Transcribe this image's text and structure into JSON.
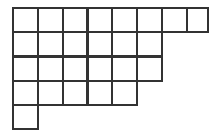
{
  "figure": {
    "name": "staircase-grid-figure",
    "background_color": "#ffffff",
    "line_color": "#333333",
    "line_width": 2.2,
    "cell_width": 24.8,
    "cell_height": 24.2,
    "origin_x": 13,
    "origin_y": 8,
    "rows": [
      {
        "index": 1,
        "cells": 8,
        "label": "row-1"
      },
      {
        "index": 2,
        "cells": 6,
        "label": "row-2"
      },
      {
        "index": 3,
        "cells": 6,
        "label": "row-3"
      },
      {
        "index": 4,
        "cells": 5,
        "label": "row-4"
      },
      {
        "index": 5,
        "cells": 1,
        "label": "row-5"
      }
    ],
    "total_cells": 26,
    "x_lines": [
      13,
      37.8,
      62.6,
      87.4,
      112.2,
      137.0,
      161.8,
      186.6,
      208.0
    ],
    "y_lines": [
      8,
      32.2,
      56.4,
      80.6,
      104.8,
      129.0
    ]
  }
}
